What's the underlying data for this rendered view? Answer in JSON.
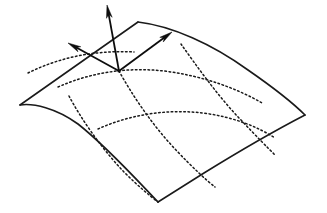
{
  "figure": {
    "type": "line-drawing",
    "width": 327,
    "height": 213,
    "background_color": "#ffffff",
    "stroke_color": "#1a1a1a",
    "vector_color": "#0d0d0d"
  },
  "geometry": {
    "base_point": {
      "x": 119,
      "y": 71
    },
    "corners": {
      "left": {
        "x": 20,
        "y": 105
      },
      "top": {
        "x": 138,
        "y": 22
      },
      "right": {
        "x": 305,
        "y": 115
      },
      "bottom": {
        "x": 158,
        "y": 202
      }
    },
    "boundary_curves": [
      {
        "name": "upper-left-edge",
        "path": "M 20 105 L 138 22",
        "style": "solid"
      },
      {
        "name": "upper-right-edge",
        "path": "M 138 22 C 172 26, 212 44, 248 70 C 274 88, 294 104, 305 115",
        "style": "solid"
      },
      {
        "name": "lower-right-edge",
        "path": "M 305 115 C 278 129, 238 152, 204 173 C 182 187, 166 197, 158 202",
        "style": "solid"
      },
      {
        "name": "lower-left-edge",
        "path": "M 158 202 C 135 178, 106 146, 78 124 C 56 108, 33 103, 20 105",
        "style": "solid"
      }
    ],
    "grid_curves": [
      {
        "name": "u-grid-line-1",
        "path": "M 58 87 C 92 72, 128 67, 164 71 C 204 76, 238 89, 262 103",
        "style": "dotted"
      },
      {
        "name": "u-grid-line-2",
        "path": "M 98 129 C 131 114, 168 109, 203 113 C 234 117, 258 127, 275 138",
        "style": "dotted"
      },
      {
        "name": "v-grid-line-1",
        "path": "M 69 96 C 80 117, 101 148, 124 172 C 138 186, 150 196, 158 202",
        "style": "dotted"
      },
      {
        "name": "v-grid-line-2",
        "path": "M 119 71 C 131 93, 152 125, 176 150 C 192 167, 206 180, 215 187",
        "style": "dotted"
      },
      {
        "name": "v-grid-line-3",
        "path": "M 181 44 C 196 65, 217 95, 240 119 C 256 136, 268 148, 275 155",
        "style": "dotted"
      },
      {
        "name": "u-grid-line-0",
        "path": "M 28 73 C 60 57, 96 50, 134 52",
        "style": "dotted"
      }
    ],
    "vectors": [
      {
        "name": "normal-vector",
        "label": "normal",
        "from": {
          "x": 119,
          "y": 71
        },
        "to": {
          "x": 107,
          "y": 5
        },
        "arrowhead": "filled-narrow"
      },
      {
        "name": "tangent-vector-u",
        "label": "tangent-u",
        "from": {
          "x": 119,
          "y": 71
        },
        "to": {
          "x": 68,
          "y": 43
        },
        "arrowhead": "filled-narrow"
      },
      {
        "name": "tangent-vector-v",
        "label": "tangent-v",
        "from": {
          "x": 119,
          "y": 71
        },
        "to": {
          "x": 172,
          "y": 32
        },
        "arrowhead": "filled-narrow"
      }
    ]
  }
}
